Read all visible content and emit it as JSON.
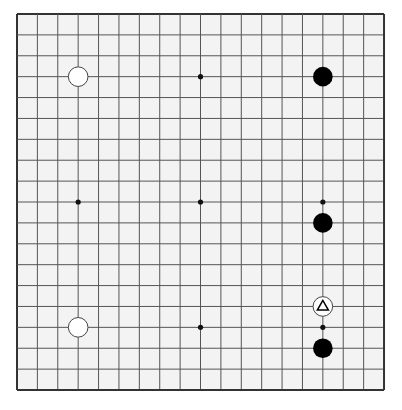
{
  "board": {
    "size": 19,
    "background_color": "#f3f3f3",
    "line_color": "#555555",
    "border_color": "#333333",
    "origin_px": [
      17,
      14
    ],
    "cell_px": [
      20.39,
      20.89
    ]
  },
  "star_points": [
    {
      "col": 3,
      "row": 3
    },
    {
      "col": 9,
      "row": 3
    },
    {
      "col": 15,
      "row": 3
    },
    {
      "col": 3,
      "row": 9
    },
    {
      "col": 9,
      "row": 9
    },
    {
      "col": 15,
      "row": 9
    },
    {
      "col": 3,
      "row": 15
    },
    {
      "col": 9,
      "row": 15
    },
    {
      "col": 15,
      "row": 15
    }
  ],
  "stones": [
    {
      "color": "white",
      "col": 3,
      "row": 3,
      "coord": "D16"
    },
    {
      "color": "black",
      "col": 15,
      "row": 3,
      "coord": "Q16"
    },
    {
      "color": "black",
      "col": 15,
      "row": 10,
      "coord": "Q9"
    },
    {
      "color": "white",
      "col": 15,
      "row": 14,
      "coord": "Q5",
      "marker": "triangle"
    },
    {
      "color": "white",
      "col": 3,
      "row": 15,
      "coord": "D4"
    },
    {
      "color": "black",
      "col": 15,
      "row": 16,
      "coord": "Q3"
    }
  ],
  "last_move_marker": {
    "type": "triangle-icon",
    "coord": "Q5"
  }
}
